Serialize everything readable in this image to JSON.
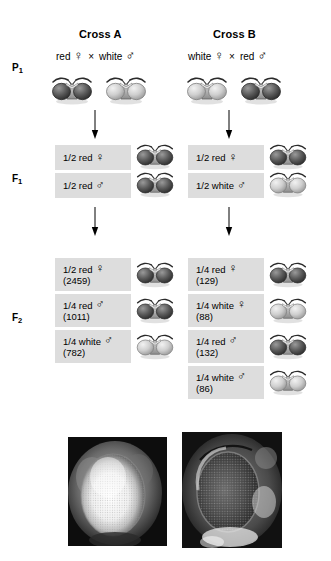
{
  "figure": {
    "columns": [
      {
        "id": "cross-a",
        "title": "Cross A"
      },
      {
        "id": "cross-b",
        "title": "Cross B"
      }
    ],
    "generation_labels": {
      "p1": "P",
      "p1_sub": "1",
      "f1": "F",
      "f1_sub": "1",
      "f2": "F",
      "f2_sub": "2"
    },
    "symbols": {
      "female": "♀",
      "male": "♂",
      "cross": "×",
      "female_name": "venus-symbol",
      "male_name": "mars-symbol"
    },
    "crosses": [
      {
        "title": "Cross A",
        "parents": {
          "mother_pheno": "red",
          "mother_symbol": "♀",
          "cross_symbol": "×",
          "father_pheno": "white",
          "father_symbol": "♂",
          "mother_eye": "dark",
          "father_eye": "light"
        },
        "f1": [
          {
            "ratio": "1/2 red",
            "symbol": "♀",
            "count": "",
            "eye": "dark"
          },
          {
            "ratio": "1/2 red",
            "symbol": "♂",
            "count": "",
            "eye": "dark"
          }
        ],
        "f2": [
          {
            "ratio": "1/2 red",
            "symbol": "♀",
            "count": "(2459)",
            "eye": "dark"
          },
          {
            "ratio": "1/4 red",
            "symbol": "♂",
            "count": "(1011)",
            "eye": "dark"
          },
          {
            "ratio": "1/4 white",
            "symbol": "♂",
            "count": "(782)",
            "eye": "light"
          }
        ]
      },
      {
        "title": "Cross B",
        "parents": {
          "mother_pheno": "white",
          "mother_symbol": "♀",
          "cross_symbol": "×",
          "father_pheno": "red",
          "father_symbol": "♂",
          "mother_eye": "light",
          "father_eye": "dark"
        },
        "f1": [
          {
            "ratio": "1/2 red",
            "symbol": "♀",
            "count": "",
            "eye": "dark"
          },
          {
            "ratio": "1/2 white",
            "symbol": "♂",
            "count": "",
            "eye": "light"
          }
        ],
        "f2": [
          {
            "ratio": "1/4 red",
            "symbol": "♀",
            "count": "(129)",
            "eye": "dark"
          },
          {
            "ratio": "1/4 white",
            "symbol": "♀",
            "count": "(88)",
            "eye": "light"
          },
          {
            "ratio": "1/4 red",
            "symbol": "♂",
            "count": "(132)",
            "eye": "dark"
          },
          {
            "ratio": "1/4 white",
            "symbol": "♂",
            "count": "(86)",
            "eye": "light"
          }
        ]
      }
    ],
    "photographs": [
      {
        "id": "white-eye-photo",
        "eye": "white"
      },
      {
        "id": "red-eye-photo",
        "eye": "red"
      }
    ],
    "colors": {
      "box_fill": "#dddddd",
      "text": "#000000",
      "background": "#ffffff",
      "dark_eye": "#4a4a4a",
      "light_eye": "#c9c9c9"
    }
  }
}
